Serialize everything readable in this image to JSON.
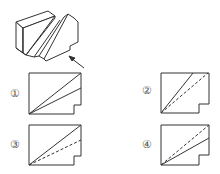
{
  "figure": {
    "arrow": "view-direction-arrow"
  },
  "options": [
    {
      "label": "①",
      "id": "1",
      "lines": "two solid diagonals"
    },
    {
      "label": "②",
      "id": "2",
      "lines": "solid steep diagonal + dashed diagonal"
    },
    {
      "label": "③",
      "id": "3",
      "lines": "solid diagonal + dashed lower diagonal"
    },
    {
      "label": "④",
      "id": "4",
      "lines": "dashed diagonal + solid lower diagonal"
    }
  ],
  "colors": {
    "stroke": "#333333",
    "label": "#555555"
  }
}
